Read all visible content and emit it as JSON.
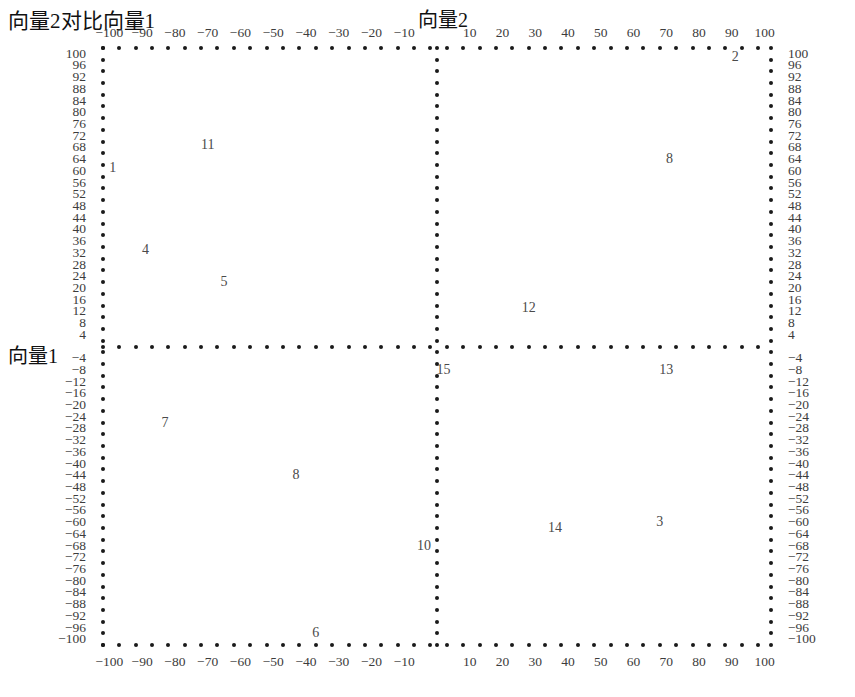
{
  "titles": {
    "main": "向量2对比向量1",
    "top_axis": "向量2",
    "left_axis": "向量1"
  },
  "chart_data": {
    "type": "scatter",
    "title": "向量2对比向量1",
    "xlabel": "向量2",
    "ylabel": "向量1",
    "xlim": [
      -105,
      105
    ],
    "ylim": [
      -103,
      103
    ],
    "grid": false,
    "legend": null,
    "axes_style": "dotted-crosshair-quadrants",
    "x_tick_step": 5,
    "x_label_step": 10,
    "y_tick_step": 4,
    "x_tick_labels": [
      -100,
      -90,
      -80,
      -70,
      -60,
      -50,
      -40,
      -30,
      -20,
      -10,
      10,
      20,
      30,
      40,
      50,
      60,
      70,
      80,
      90,
      100
    ],
    "y_tick_labels": [
      100,
      96,
      92,
      88,
      84,
      80,
      76,
      72,
      68,
      64,
      60,
      56,
      52,
      48,
      44,
      40,
      36,
      32,
      28,
      24,
      20,
      16,
      12,
      8,
      4,
      -4,
      -8,
      -12,
      -16,
      -20,
      -24,
      -28,
      -32,
      -36,
      -40,
      -44,
      -48,
      -52,
      -56,
      -60,
      -64,
      -68,
      -72,
      -76,
      -80,
      -84,
      -88,
      -92,
      -96,
      -100
    ],
    "x_axis_positions": [
      "top",
      "bottom"
    ],
    "y_axis_positions": [
      "left",
      "right"
    ],
    "points": [
      {
        "label": "1",
        "x": -99,
        "y": 61
      },
      {
        "label": "11",
        "x": -70,
        "y": 69
      },
      {
        "label": "4",
        "x": -89,
        "y": 33
      },
      {
        "label": "5",
        "x": -65,
        "y": 22
      },
      {
        "label": "2",
        "x": 91,
        "y": 99
      },
      {
        "label": "8",
        "x": 71,
        "y": 64
      },
      {
        "label": "12",
        "x": 28,
        "y": 13
      },
      {
        "label": "15",
        "x": 2,
        "y": -8
      },
      {
        "label": "13",
        "x": 70,
        "y": -8
      },
      {
        "label": "7",
        "x": -83,
        "y": -26
      },
      {
        "label": "8",
        "x": -43,
        "y": -44
      },
      {
        "label": "10",
        "x": -4,
        "y": -68
      },
      {
        "label": "14",
        "x": 36,
        "y": -62
      },
      {
        "label": "3",
        "x": 68,
        "y": -60
      },
      {
        "label": "6",
        "x": -37,
        "y": -98
      }
    ]
  }
}
